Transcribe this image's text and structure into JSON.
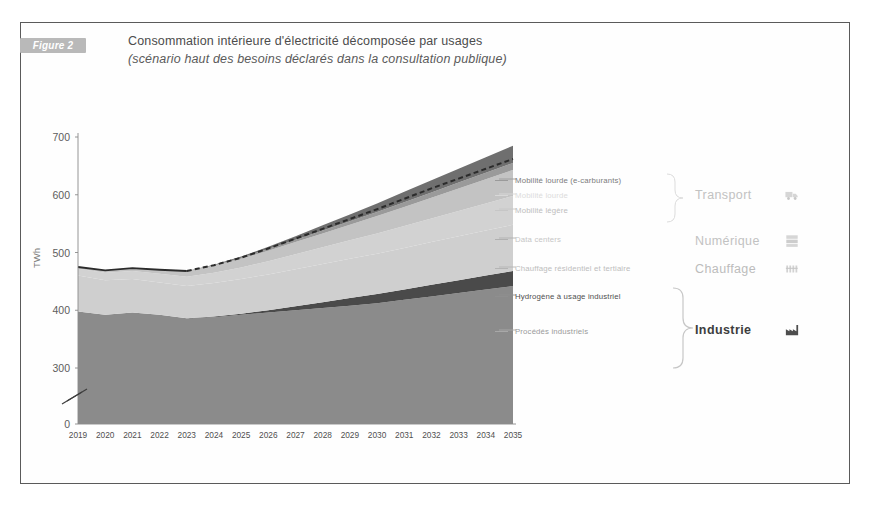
{
  "figure": {
    "badge": "Figure 2",
    "title_line_1": "Consommation intérieure d'électricité décomposée par usages",
    "title_line_2": "(scénario haut des besoins déclarés dans la consultation publique)"
  },
  "colors": {
    "badge_bg": "#b9b9b9",
    "frame_border": "#5a5a5a",
    "mobilite_lourde_ecarb": "#6f6f6f",
    "mobilite_lourde": "#9a9a9a",
    "mobilite_legere": "#c3c3c3",
    "data_centers": "#d2d2d2",
    "chauffage": "#cfcfcf",
    "hydrogene": "#4a4a4a",
    "procedes": "#8b8b8b",
    "base": "#e3e3e3",
    "total_line": "#2b2b2b",
    "axis": "#8a8a8a",
    "text_dark": "#4c4c4c",
    "text_faint": "#c0c0c0"
  },
  "legend": {
    "items": [
      {
        "key": "mobilite_lourde_ecarb",
        "label": "Mobilité lourde (e-carburants)",
        "text_color": "#7c7c7c",
        "dash_color": "#9a9a9a"
      },
      {
        "key": "mobilite_lourde",
        "label": "Mobilité lourde",
        "text_color": "#dcdcdc",
        "dash_color": "#d8d8d8"
      },
      {
        "key": "mobilite_legere",
        "label": "Mobilité légère",
        "text_color": "#bdbdbd",
        "dash_color": "#c6c6c6"
      },
      {
        "key": "data_centers",
        "label": "Data centers",
        "text_color": "#c6c6c6",
        "dash_color": "#b0b0b0"
      },
      {
        "key": "chauffage",
        "label": "Chauffage résidentiel et tertiaire",
        "text_color": "#bdbdbd",
        "dash_color": "#b4b4b4"
      },
      {
        "key": "hydrogene",
        "label": "Hydrogène à usage industriel",
        "text_color": "#4f4f4f",
        "dash_color": "#8f8f8f"
      },
      {
        "key": "procedes",
        "label": "Procédés industriels",
        "text_color": "#9a9a9a",
        "dash_color": "#a8a8a8"
      }
    ],
    "groups": [
      {
        "key": "transport",
        "label": "Transport",
        "icon": "truck-icon",
        "text_color": "#c2c2c2"
      },
      {
        "key": "numerique",
        "label": "Numérique",
        "icon": "server-icon",
        "text_color": "#c2c2c2"
      },
      {
        "key": "chauffage",
        "label": "Chauffage",
        "icon": "radiator-icon",
        "text_color": "#bcbcbc"
      },
      {
        "key": "industrie",
        "label": "Industrie",
        "icon": "factory-icon",
        "text_color": "#3d3d3d"
      }
    ]
  },
  "chart_data": {
    "type": "area",
    "title": "Consommation intérieure d'électricité décomposée par usages",
    "subtitle": "(scénario haut des besoins déclarés dans la consultation publique)",
    "xlabel": "",
    "ylabel": "TWh",
    "ylim": [
      0,
      700
    ],
    "y_ticks": [
      0,
      300,
      400,
      500,
      600,
      700
    ],
    "y_axis_break": true,
    "y_break_between": [
      0,
      300
    ],
    "grid": false,
    "legend_position": "right",
    "stacked": true,
    "x": [
      "2019",
      "2020",
      "2021",
      "2022",
      "2023",
      "2024",
      "2025",
      "2026",
      "2027",
      "2028",
      "2029",
      "2030",
      "2031",
      "2032",
      "2033",
      "2034",
      "2035"
    ],
    "categories": [
      "2019",
      "2020",
      "2021",
      "2022",
      "2023",
      "2024",
      "2025",
      "2026",
      "2027",
      "2028",
      "2029",
      "2030",
      "2031",
      "2032",
      "2033",
      "2034",
      "2035"
    ],
    "series": [
      {
        "name": "Procédés industriels",
        "group": "Industrie",
        "color": "#8b8b8b",
        "values": [
          398,
          392,
          396,
          392,
          386,
          388,
          392,
          396,
          400,
          404,
          408,
          412,
          418,
          424,
          430,
          436,
          442
        ]
      },
      {
        "name": "Hydrogène à usage industriel",
        "group": "Industrie",
        "color": "#4a4a4a",
        "values": [
          0,
          0,
          0,
          0,
          0,
          1,
          2,
          4,
          7,
          10,
          13,
          16,
          18,
          20,
          22,
          24,
          26
        ]
      },
      {
        "name": "Chauffage résidentiel et tertiaire",
        "group": "Chauffage",
        "color": "#cfcfcf",
        "values": [
          62,
          60,
          58,
          56,
          56,
          58,
          60,
          62,
          64,
          66,
          68,
          70,
          72,
          74,
          76,
          78,
          80
        ]
      },
      {
        "name": "Data centers",
        "group": "Numérique",
        "color": "#d2d2d2",
        "values": [
          12,
          13,
          14,
          15,
          16,
          18,
          20,
          23,
          26,
          29,
          32,
          35,
          38,
          41,
          44,
          47,
          50
        ]
      },
      {
        "name": "Mobilité légère",
        "group": "Transport",
        "color": "#c3c3c3",
        "values": [
          3,
          4,
          5,
          7,
          9,
          12,
          15,
          18,
          21,
          24,
          27,
          30,
          33,
          36,
          39,
          42,
          45
        ]
      },
      {
        "name": "Mobilité lourde",
        "group": "Transport",
        "color": "#9a9a9a",
        "values": [
          0,
          0,
          0,
          0,
          1,
          1,
          2,
          3,
          4,
          5,
          6,
          7,
          8,
          9,
          10,
          11,
          12
        ]
      },
      {
        "name": "Mobilité lourde (e-carburants)",
        "group": "Transport",
        "color": "#6f6f6f",
        "values": [
          0,
          0,
          0,
          0,
          0,
          1,
          2,
          4,
          6,
          9,
          12,
          15,
          18,
          21,
          24,
          27,
          30
        ]
      }
    ],
    "total": {
      "name": "Total",
      "style": "solid-then-dashed",
      "solid_until": "2022",
      "values": [
        475,
        469,
        473,
        470,
        468,
        479,
        493,
        510,
        528,
        547,
        566,
        585,
        605,
        625,
        645,
        665,
        685
      ]
    },
    "total_displayed": [
      475,
      469,
      473,
      470,
      468,
      478,
      491,
      507,
      524,
      541,
      558,
      575,
      593,
      611,
      628,
      645,
      662
    ]
  }
}
